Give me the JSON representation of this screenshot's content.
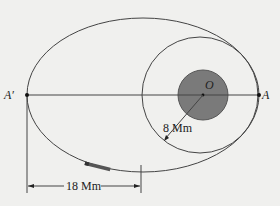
{
  "diagram": {
    "labels": {
      "a_prime": "A′",
      "a": "A",
      "o": "O",
      "radius": "8 Mm",
      "distance": "18 Mm"
    },
    "colors": {
      "background": "#f0f0ee",
      "line": "#444444",
      "planet_fill": "#7a7a7a",
      "planet_stroke": "#555555"
    },
    "geometry": {
      "large_ellipse": {
        "cx": 143,
        "cy": 95,
        "rx": 116,
        "ry": 77
      },
      "small_circle": {
        "cx": 200,
        "cy": 95,
        "r": 58
      },
      "planet": {
        "cx": 203,
        "cy": 95,
        "r": 25
      }
    }
  }
}
